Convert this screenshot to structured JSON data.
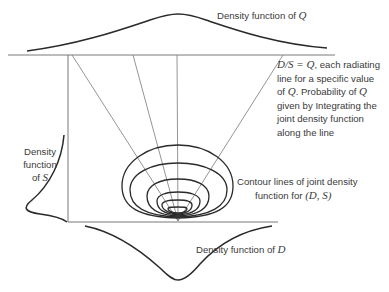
{
  "labels": {
    "q_density": {
      "text": "Density function of ",
      "var": "Q"
    },
    "ds_note": {
      "line1_math": "D/S = Q",
      "line1_rest": ", each radiating",
      "line2": "line for a specific value",
      "line3_pre": "of ",
      "line3_var": "Q",
      "line3_mid": ". Probability of ",
      "line3_var2": "Q",
      "line4": "given by Integrating the",
      "line5": "joint density function",
      "line6": "along the line"
    },
    "s_density": {
      "line1": "Density",
      "line2": "function",
      "line3_pre": "of ",
      "line3_var": "S"
    },
    "contours": {
      "line1": "Contour lines of joint density",
      "line2_pre": "function for ",
      "line2_var": "(D, S)"
    },
    "d_density": {
      "text": "Density function of ",
      "var": "D"
    }
  },
  "colors": {
    "line": "#2a2a2a",
    "thin_line": "#7a7a7a",
    "text": "#3a3a3a"
  }
}
